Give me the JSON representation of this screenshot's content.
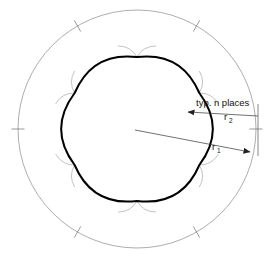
{
  "diagram": {
    "canvas": {
      "width": 274,
      "height": 263,
      "background": "#ffffff"
    },
    "colors": {
      "outer_circle": "#8a8a8a",
      "construction": "#9a9a9a",
      "profile": "#000000",
      "dimension": "#333333",
      "text": "#111111"
    },
    "outer_circle": {
      "name": "outer-circle",
      "center_x": 137,
      "center_y": 129,
      "radius": 119,
      "stroke_width": 0.7
    },
    "tick_marks": {
      "name": "outer-circle-tick-marks",
      "count": 6,
      "angles_deg": [
        180,
        240,
        300,
        0,
        60,
        120
      ],
      "length": 13,
      "stroke_width": 0.7
    },
    "profile": {
      "name": "scalloped-hexagon-profile",
      "vertex_count": 6,
      "vertex_radius": 72,
      "arc_bulge": 0.3,
      "stroke_width": 2.0,
      "vertex_angles_deg": [
        270,
        330,
        30,
        90,
        150,
        210
      ]
    },
    "construction_arcs": {
      "name": "construction-arcs",
      "count": 6,
      "extension": 22,
      "stroke_width": 0.6
    },
    "dimensions": [
      {
        "id": "r2",
        "name": "dimension-r2",
        "letter": "r",
        "subscript": "2",
        "label_x": 224,
        "label_y": 120,
        "arrow_from_x": 258,
        "arrow_from_y": 116,
        "arrow_to_x": 188,
        "arrow_to_y": 112,
        "arrow_head": "left"
      },
      {
        "id": "r1",
        "name": "dimension-r1",
        "letter": "r",
        "subscript": "1",
        "label_x": 212,
        "label_y": 150,
        "arrow_from_x": 135,
        "arrow_from_y": 130,
        "arrow_to_x": 250,
        "arrow_to_y": 152,
        "arrow_head": "right"
      }
    ],
    "extension_line": {
      "name": "extension-line-right",
      "x": 258,
      "y1": 104,
      "y2": 156
    },
    "annotation": {
      "name": "typ-n-places-note",
      "text": "typ. n places",
      "x": 196,
      "y": 106
    }
  }
}
